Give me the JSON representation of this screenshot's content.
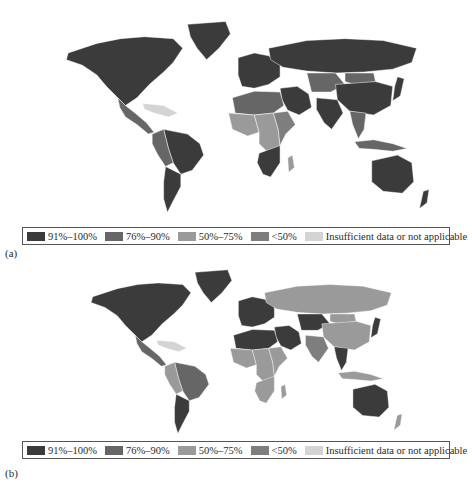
{
  "colors": {
    "c91_100": "#3b3b3b",
    "c76_90": "#666666",
    "c50_75": "#9a9a9a",
    "lt50": "#7e7e7e",
    "insufficient": "#d4d4d4",
    "ocean": "#ffffff"
  },
  "legend": {
    "items": [
      {
        "label": "91%–100%",
        "key": "c91_100"
      },
      {
        "label": "76%–90%",
        "key": "c76_90"
      },
      {
        "label": "50%–75%",
        "key": "c50_75"
      },
      {
        "label": "<50%",
        "key": "lt50"
      },
      {
        "label": "Insufficient data or not applicable",
        "key": "insufficient"
      }
    ]
  },
  "panels": [
    {
      "label": "(a)",
      "regions": {
        "north_america": "c91_100",
        "greenland": "c91_100",
        "central_america": "c76_90",
        "caribbean": "insufficient",
        "south_america_east": "c91_100",
        "south_america_west": "c76_90",
        "south_america_south": "c91_100",
        "europe": "c91_100",
        "russia": "c91_100",
        "middle_east": "c91_100",
        "north_africa": "c76_90",
        "west_africa": "c50_75",
        "central_africa": "c50_75",
        "east_africa": "lt50",
        "southern_africa": "c91_100",
        "madagascar": "c50_75",
        "central_asia": "c76_90",
        "mongolia": "c76_90",
        "china": "c91_100",
        "india": "c91_100",
        "southeast_asia": "c76_90",
        "japan": "c91_100",
        "indonesia": "c76_90",
        "australia": "c91_100",
        "new_zealand": "c91_100"
      }
    },
    {
      "label": "(b)",
      "regions": {
        "north_america": "c91_100",
        "greenland": "c91_100",
        "central_america": "c76_90",
        "caribbean": "insufficient",
        "south_america_east": "c76_90",
        "south_america_west": "c50_75",
        "south_america_south": "c91_100",
        "europe": "c91_100",
        "russia": "c50_75",
        "middle_east": "c91_100",
        "north_africa": "c91_100",
        "west_africa": "c50_75",
        "central_africa": "c50_75",
        "east_africa": "c50_75",
        "southern_africa": "c50_75",
        "madagascar": "c50_75",
        "central_asia": "c91_100",
        "mongolia": "c50_75",
        "china": "c50_75",
        "india": "lt50",
        "southeast_asia": "c91_100",
        "japan": "c91_100",
        "indonesia": "c50_75",
        "australia": "c91_100",
        "new_zealand": "c50_75"
      }
    }
  ]
}
